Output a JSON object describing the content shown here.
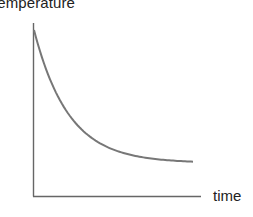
{
  "chart_data": {
    "type": "line",
    "title": "",
    "xlabel": "time",
    "ylabel": "temperature",
    "grid": false,
    "legend": null,
    "x_ticks": [],
    "y_ticks": [],
    "series": [
      {
        "name": "temperature",
        "x": [
          0,
          0.1,
          0.2,
          0.3,
          0.4,
          0.5,
          0.6,
          0.7,
          0.8,
          0.9,
          1.0
        ],
        "values": [
          1.0,
          0.66,
          0.44,
          0.3,
          0.21,
          0.15,
          0.12,
          0.1,
          0.09,
          0.088,
          0.087
        ]
      }
    ],
    "xlim": [
      0,
      1.05
    ],
    "ylim": [
      0,
      1.04
    ],
    "line_color": "#777777",
    "axis_color": "#666666"
  }
}
